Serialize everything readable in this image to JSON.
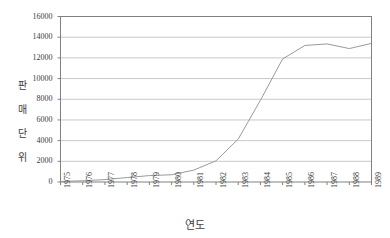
{
  "chart_data": {
    "type": "line",
    "title": "",
    "xlabel": "연도",
    "ylabel": "판매단위",
    "ylim": [
      0,
      16000
    ],
    "yticks": [
      0,
      2000,
      4000,
      6000,
      8000,
      10000,
      12000,
      14000,
      16000
    ],
    "ytick_labels": [
      "0",
      "2000",
      "4000",
      "6000",
      "8000",
      "10000",
      "12000",
      "14000",
      "16000"
    ],
    "grid": true,
    "legend": "none",
    "categories": [
      "1975",
      "1976",
      "1977",
      "1978",
      "1979",
      "1980",
      "1981",
      "1982",
      "1983",
      "1984",
      "1985",
      "1986",
      "1987",
      "1988",
      "1989"
    ],
    "values": [
      50,
      120,
      230,
      430,
      620,
      700,
      1150,
      2050,
      4150,
      7900,
      11900,
      13200,
      13350,
      12900,
      13400
    ],
    "series": [
      {
        "name": "판매단위",
        "color": "#9a9a9a",
        "values": [
          50,
          120,
          230,
          430,
          620,
          700,
          1150,
          2050,
          4150,
          7900,
          11900,
          13200,
          13350,
          12900,
          13400
        ]
      }
    ]
  },
  "axes": {
    "frame_color": "#808080",
    "grid_color": "#c9c9c9",
    "line_color": "#9a9a9a"
  }
}
